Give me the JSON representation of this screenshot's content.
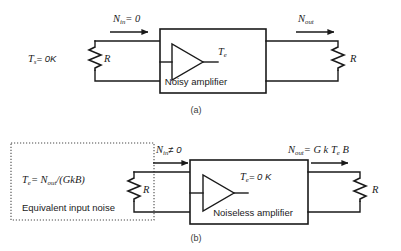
{
  "figure": {
    "title_present": false,
    "background_color": "#ffffff",
    "line_color": "#1a1a1a",
    "text_color": "#1a1a1a"
  },
  "panel_a": {
    "caption": "(a)",
    "source_temp_label": "T",
    "source_temp_sub": "s",
    "source_temp_value": "= 0K",
    "left_resistor_label": "R",
    "right_resistor_label": "R",
    "input_noise_label": "N",
    "input_noise_sub": "in",
    "input_noise_value": "= 0",
    "output_noise_label": "N",
    "output_noise_sub": "out",
    "amp_temp_label": "T",
    "amp_temp_sub": "e",
    "amp_name": "Noisy amplifier"
  },
  "panel_b": {
    "caption": "(b)",
    "equivalent_noise_box": {
      "formula_lead": "T",
      "formula_lead_sub": "e",
      "formula_eq": "= N",
      "formula_eq_sub": "out",
      "formula_tail": "/(GkB)",
      "description": "Equivalent input noise"
    },
    "left_resistor_label": "R",
    "right_resistor_label": "R",
    "input_noise_label": "N",
    "input_noise_sub": "in",
    "input_noise_value": "≠ 0",
    "output_noise_label": "N",
    "output_noise_sub": "out",
    "output_noise_value": "= G k T",
    "output_noise_sub2": "e",
    "output_noise_tail": "B",
    "amp_temp_label": "T",
    "amp_temp_sub": "e",
    "amp_temp_value": "= 0 K",
    "amp_name": "Noiseless amplifier"
  }
}
